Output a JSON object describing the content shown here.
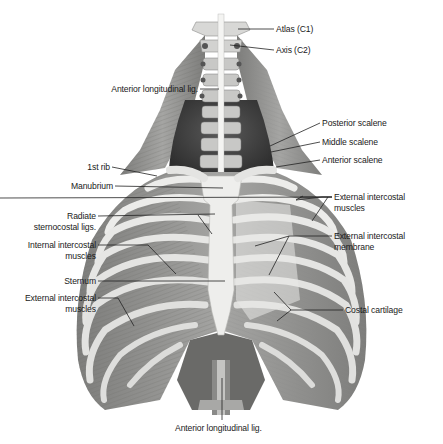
{
  "figure": {
    "colors": {
      "bone": "#e8e8e6",
      "bone_shade": "#bdbdbb",
      "muscle": "#9a9a98",
      "muscle_dark": "#6e6e6c",
      "cavity": "#3c3c3c",
      "leader": "#222222",
      "text": "#1a1a1a"
    }
  },
  "labels": {
    "atlas": "Atlas (C1)",
    "axis": "Axis (C2)",
    "anterior_longitudinal_top": "Anterior longitudinal lig.",
    "posterior_scalene": "Posterior scalene",
    "middle_scalene": "Middle scalene",
    "anterior_scalene": "Anterior scalene",
    "first_rib": "1st rib",
    "manubrium": "Manubrium",
    "external_intercostal_right": [
      "External intercostal",
      "muscles"
    ],
    "radiate_sternocostal": [
      "Radiate",
      "sternocostal ligs."
    ],
    "external_intercostal_membrane": [
      "External intercostal",
      "membrane"
    ],
    "internal_intercostal": [
      "Internal intercostal",
      "muscles"
    ],
    "sternum": "Sternum",
    "external_intercostal_left": [
      "External intercostal",
      "muscles"
    ],
    "costal_cartilage": "Costal cartilage",
    "anterior_longitudinal_bottom": "Anterior longitudinal lig."
  }
}
